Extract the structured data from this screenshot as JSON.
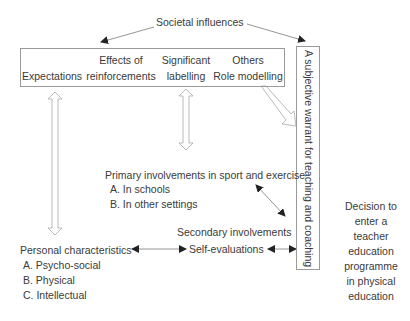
{
  "diagram": {
    "source_node": {
      "label": "Societal influences"
    },
    "influence_box": {
      "items": [
        {
          "line1": "",
          "line2": "Expectations"
        },
        {
          "line1": "Effects of",
          "line2": "reinforcements"
        },
        {
          "line1": "Significant",
          "line2": "labelling"
        },
        {
          "line1": "Others",
          "line2": "Role modelling"
        }
      ]
    },
    "warrant_box": {
      "label": "A subjective warrant for teaching and coaching"
    },
    "primary_involvements": {
      "title": "Primary involvements in sport and exercise",
      "items": [
        "A. In schools",
        "B. In other settings"
      ]
    },
    "secondary_involvements": {
      "label": "Secondary involvements"
    },
    "self_evaluations": {
      "label": "Self-evaluations"
    },
    "personal_characteristics": {
      "title": "Personal characteristics",
      "items": [
        "A. Psycho-social",
        "B. Physical",
        "C. Intellectual"
      ]
    },
    "decision": {
      "lines": [
        "Decision to",
        "enter a",
        "teacher",
        "education",
        "programme",
        "in physical",
        "education"
      ]
    },
    "colors": {
      "line": "#7a7a7a",
      "box_border": "#9a9a9a",
      "text": "#3a3a3a",
      "arrow_head": "#222222"
    }
  }
}
